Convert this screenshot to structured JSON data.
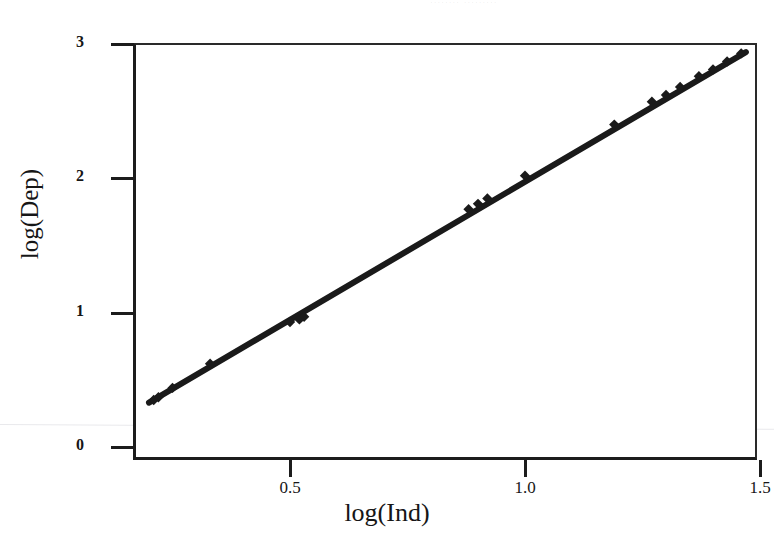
{
  "chart_data": {
    "type": "scatter",
    "title": "",
    "xlabel": "log(Ind)",
    "ylabel": "log(Dep)",
    "xlim": [
      0.18,
      1.51
    ],
    "ylim": [
      -0.09,
      3.09
    ],
    "xticks": [
      "0.5",
      "1.0",
      "1.5"
    ],
    "xtick_values": [
      0.5,
      1.0,
      1.5
    ],
    "yticks": [
      "0",
      "1",
      "2",
      "3"
    ],
    "ytick_values": [
      0,
      1,
      2,
      3
    ],
    "grid": false,
    "legend": null,
    "marker": "diamond",
    "line_color": "#1a1a1a",
    "marker_color": "#1a1a1a",
    "series": [
      {
        "name": "log(Dep) vs log(Ind)",
        "x": [
          0.21,
          0.22,
          0.25,
          0.33,
          0.5,
          0.52,
          0.53,
          0.88,
          0.9,
          0.92,
          1.0,
          1.19,
          1.27,
          1.3,
          1.33,
          1.37,
          1.4,
          1.43,
          1.46
        ],
        "y": [
          0.35,
          0.37,
          0.44,
          0.62,
          0.93,
          0.95,
          0.97,
          1.77,
          1.81,
          1.85,
          2.02,
          2.4,
          2.57,
          2.62,
          2.68,
          2.76,
          2.81,
          2.87,
          2.93
        ]
      }
    ],
    "fit_line": {
      "name": "regression line",
      "x": [
        0.2,
        1.47
      ],
      "y": [
        0.33,
        2.94
      ]
    },
    "title_remnant": "........ ........."
  }
}
